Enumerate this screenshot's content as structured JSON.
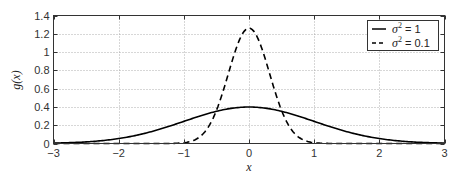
{
  "chart_data": {
    "type": "line",
    "title": "",
    "xlabel": "x",
    "ylabel": "g(x)",
    "xlim": [
      -3,
      3
    ],
    "ylim": [
      0,
      1.4
    ],
    "xticks": [
      -3,
      -2,
      -1,
      0,
      1,
      2,
      3
    ],
    "yticks": [
      0,
      0.2,
      0.4,
      0.6,
      0.8,
      1,
      1.2,
      1.4
    ],
    "xtick_labels": [
      "−3",
      "−2",
      "−1",
      "0",
      "1",
      "2",
      "3"
    ],
    "ytick_labels": [
      "0",
      "0.2",
      "0.4",
      "0.6",
      "0.8",
      "1",
      "1.2",
      "1.4"
    ],
    "grid": true,
    "grid_style": "dotted",
    "legend_position": "upper right",
    "series": [
      {
        "name": "σ² = 1",
        "legend_sigma": "σ",
        "legend_exp": "2",
        "legend_value": " = 1",
        "variance": 1,
        "line_style": "solid",
        "color": "#000000",
        "x": [
          -3,
          -2.5,
          -2,
          -1.5,
          -1,
          -0.5,
          0,
          0.5,
          1,
          1.5,
          2,
          2.5,
          3
        ],
        "y": [
          0.0044,
          0.0175,
          0.054,
          0.1295,
          0.242,
          0.3521,
          0.3989,
          0.3521,
          0.242,
          0.1295,
          0.054,
          0.0175,
          0.0044
        ]
      },
      {
        "name": "σ² = 0.1",
        "legend_sigma": "σ",
        "legend_exp": "2",
        "legend_value": " = 0.1",
        "variance": 0.1,
        "line_style": "dashed",
        "color": "#000000",
        "x": [
          -3,
          -1.5,
          -1,
          -0.75,
          -0.5,
          -0.25,
          0,
          0.25,
          0.5,
          0.75,
          1,
          1.5,
          3
        ],
        "y": [
          0.0,
          0.0,
          0.0085,
          0.0751,
          0.3614,
          0.9205,
          1.2616,
          0.9205,
          0.3614,
          0.0751,
          0.0085,
          0.0,
          0.0
        ]
      }
    ]
  }
}
